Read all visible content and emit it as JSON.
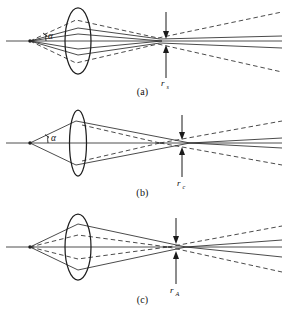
{
  "figure": {
    "background_color": "#ffffff",
    "line_color": "#2b2b2b",
    "lens_color": "#1f1f1f"
  },
  "panels": [
    {
      "id": "a",
      "caption": "(a)",
      "radius_symbol": "r",
      "radius_subscript": "s",
      "angle_symbol": "α",
      "has_angle_label": true,
      "lens_width_class": "wide"
    },
    {
      "id": "b",
      "caption": "(b)",
      "radius_symbol": "r",
      "radius_subscript": "c",
      "angle_symbol": "α",
      "has_angle_label": true,
      "lens_width_class": "narrow"
    },
    {
      "id": "c",
      "caption": "(c)",
      "radius_symbol": "r",
      "radius_subscript": "A",
      "angle_symbol": "α",
      "has_angle_label": false,
      "lens_width_class": "wide"
    }
  ]
}
